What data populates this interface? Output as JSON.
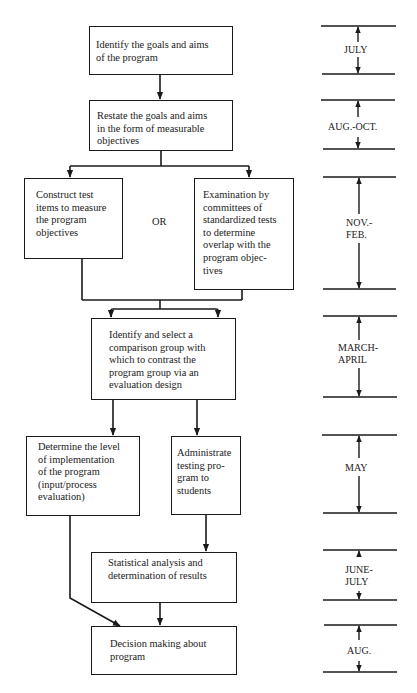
{
  "flowchart": {
    "steps": {
      "identify_goals": "Identify the goals and aims\nof the program",
      "restate_goals": "Restate the goals and aims\nin the form of measurable\nobjectives",
      "construct_test": "Construct test\nitems to measure\nthe program\nobjectives",
      "or_label": "OR",
      "examination": "Examination by\ncommittees of\nstandardized tests\nto determine\noverlap with the\nprogram objec-\ntives",
      "identify_comparison": "Identify and select a\ncomparison group with\nwhich to contrast the\nprogram group via an\nevaluation design",
      "determine_level": "Determine the level\nof implementation\nof the program\n(input/process\nevaluation)",
      "administrate": "Administrate\ntesting pro-\ngram to\nstudents",
      "statistical": "Statistical analysis and\ndetermination of results",
      "decision": "Decision making about\nprogram"
    }
  },
  "timeline": {
    "periods": [
      {
        "label": "JULY"
      },
      {
        "label": "AUG.-OCT."
      },
      {
        "label": "NOV.-\nFEB."
      },
      {
        "label": "MARCH-\nAPRIL"
      },
      {
        "label": "MAY"
      },
      {
        "label": "JUNE-\nJULY"
      },
      {
        "label": "AUG."
      }
    ]
  },
  "colors": {
    "ink": "#1a1a1a",
    "paper": "#ffffff"
  }
}
